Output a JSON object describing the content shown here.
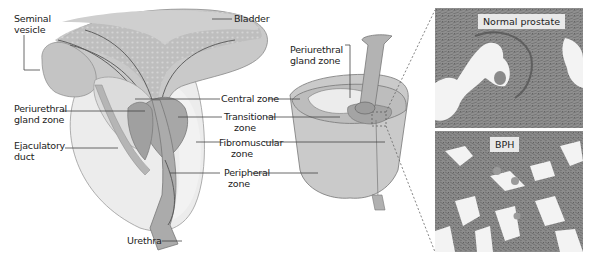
{
  "figure": {
    "sagittal_view": {
      "labels": {
        "bladder": "Bladder",
        "seminal_vesicle": "Seminal\nvesicle",
        "periurethral_gland_zone": "Periurethral\ngland zone",
        "ejaculatory_duct": "Ejaculatory\nduct",
        "urethra": "Urethra"
      }
    },
    "shared_labels": {
      "central_zone": "Central zone",
      "transitional_zone": "Transitional\nzone",
      "fibromuscular_zone": "Fibromuscular\nzone",
      "peripheral_zone": "Peripheral\nzone"
    },
    "cutaway_view": {
      "labels": {
        "periurethral_gland_zone": "Periurethral\ngland zone"
      }
    },
    "micrographs": [
      {
        "tag": "Normal prostate"
      },
      {
        "tag": "BPH"
      }
    ],
    "colors": {
      "outline": "#555555",
      "bladder": "#c8c8c8",
      "peripheral": "#e6e6e6",
      "transitional": "#a9a9a9",
      "central": "#bdbdbd",
      "tissue": "#8a8a8a",
      "lumen": "#f4f4f4"
    }
  }
}
